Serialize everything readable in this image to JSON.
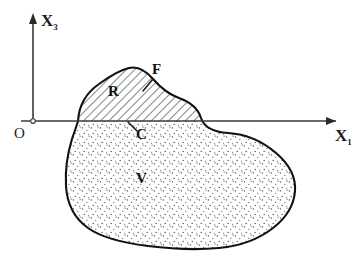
{
  "figure": {
    "name": "continuum-body-cut-diagram",
    "background_color": "#ffffff",
    "ink_color": "#1a1a1a",
    "outline_color": "#111111"
  },
  "axes": {
    "vertical": {
      "label_base": "X",
      "label_subscript": "3",
      "arrow": "up-arrow-head",
      "x": 33,
      "y_top": 14,
      "y_bottom": 124
    },
    "horizontal": {
      "label_base": "X",
      "label_subscript": "1",
      "arrow": "right-arrow-head",
      "y": 121,
      "x_left": 21,
      "x_right": 340
    },
    "origin": {
      "label": "O",
      "marker": "origin-circle",
      "x": 33,
      "y": 121
    }
  },
  "regions": [
    {
      "id": "R",
      "label": "R",
      "description": "hatched region above the cut",
      "fill_pattern": "diagonal-hatch",
      "label_x": 114,
      "label_y": 96
    },
    {
      "id": "V",
      "label": "V",
      "description": "stippled volume below the cut",
      "fill_pattern": "stipple-dots",
      "label_x": 142,
      "label_y": 182
    }
  ],
  "annotations": [
    {
      "id": "F",
      "label": "F",
      "description": "upper bounding surface of region R",
      "label_x": 157,
      "label_y": 73,
      "leader_from_x": 153,
      "leader_from_y": 78,
      "leader_to_x": 143,
      "leader_to_y": 91
    },
    {
      "id": "C",
      "label": "C",
      "description": "cut plane interface along the X1 axis",
      "label_x": 141,
      "label_y": 137,
      "leader_from_x": 137,
      "leader_from_y": 131,
      "leader_to_x": 128,
      "leader_to_y": 122
    }
  ],
  "colors": {
    "ink": "#1a1a1a",
    "outline": "#111111",
    "hatch": "#2a2a2a",
    "stipple": "#4a4a4a",
    "background": "#ffffff"
  }
}
